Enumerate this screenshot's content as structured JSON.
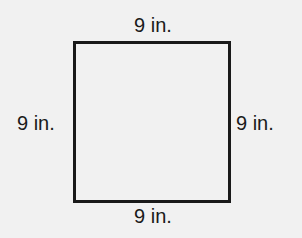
{
  "figure": {
    "shape": "square",
    "labels": {
      "top": "9 in.",
      "bottom": "9 in.",
      "left": "9 in.",
      "right": "9 in."
    }
  }
}
